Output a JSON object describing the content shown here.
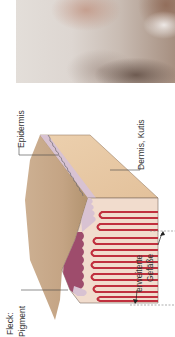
{
  "photo": {
    "description": "clinical skin photograph",
    "semantic": "skin-photo"
  },
  "diagram": {
    "orientation": "rotated 90deg counter-clockwise",
    "labels": {
      "epidermis": "Epidermis",
      "dermis": "Dermis, Kutis",
      "vessels_line1": "erweiterte",
      "vessels_line2": "Gefäße",
      "fleck": "Fleck:",
      "pigment": "Pigment"
    },
    "colors": {
      "dermis_top": "#e8c9a6",
      "dermis_side": "#c9ab8a",
      "epidermis": "#d9c3d3",
      "pigment": "#9c4a6a",
      "vessel": "#c0303e",
      "vessel_inner": "#f1d6cf",
      "line": "#555555"
    }
  }
}
